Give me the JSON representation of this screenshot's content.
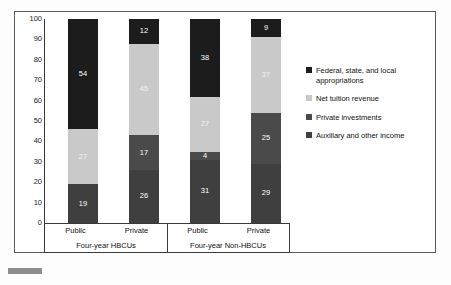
{
  "chart_data": {
    "type": "bar",
    "stacked": true,
    "title": "",
    "xlabel": "",
    "ylabel": "",
    "ylim": [
      0,
      100
    ],
    "yticks": [
      0,
      10,
      20,
      30,
      40,
      50,
      60,
      70,
      80,
      90,
      100
    ],
    "grid": false,
    "legend_position": "right",
    "categories": [
      "Public",
      "Private",
      "Public",
      "Private"
    ],
    "groups": [
      {
        "label": "Four-year HBCUs",
        "categories": [
          "Public",
          "Private"
        ]
      },
      {
        "label": "Four-year Non-HBCUs",
        "categories": [
          "Public",
          "Private"
        ]
      }
    ],
    "series": [
      {
        "name": "Auxillary and other income",
        "color": "#3f3f3f",
        "values": [
          19,
          26,
          31,
          29
        ]
      },
      {
        "name": "Private investments",
        "color": "#4a4a4a",
        "values": [
          0,
          17,
          4,
          25
        ]
      },
      {
        "name": "Net tuition revenue",
        "color": "#c9c9c9",
        "values": [
          27,
          45,
          27,
          37
        ]
      },
      {
        "name": "Federal, state, and local appropriations",
        "color": "#1c1c1c",
        "values": [
          54,
          12,
          38,
          9
        ]
      }
    ],
    "bar_labels": [
      [
        "19",
        "",
        "27",
        "54"
      ],
      [
        "26",
        "17",
        "45",
        "12"
      ],
      [
        "31",
        "4",
        "27",
        "38"
      ],
      [
        "29",
        "25",
        "37",
        "9"
      ]
    ]
  },
  "legend": {
    "items": [
      {
        "label": "Federal, state, and local appropriations",
        "color": "#1c1c1c"
      },
      {
        "label": "Net tuition revenue",
        "color": "#c9c9c9"
      },
      {
        "label": "Private investments",
        "color": "#4a4a4a"
      },
      {
        "label": "Auxillary and other income",
        "color": "#3f3f3f"
      }
    ]
  },
  "axis": {
    "y_labels": [
      "100",
      "90",
      "80",
      "70",
      "60",
      "50",
      "40",
      "30",
      "20",
      "10",
      "0"
    ]
  }
}
